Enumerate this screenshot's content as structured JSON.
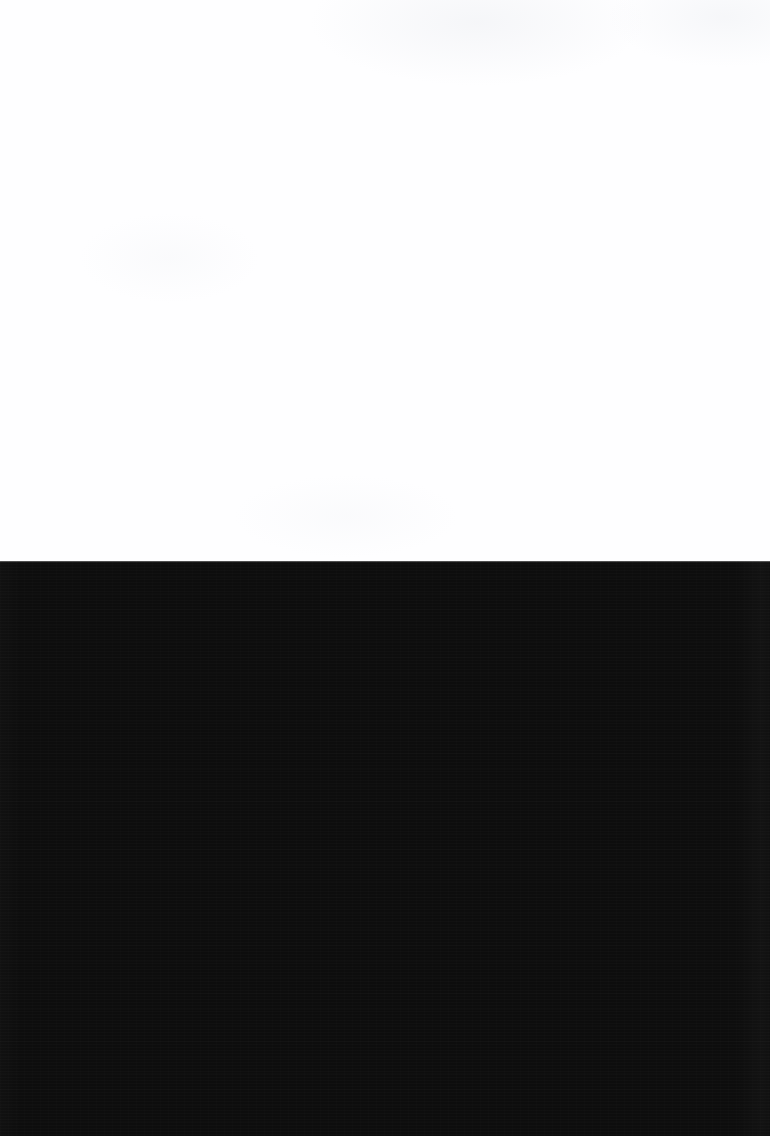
{
  "capture": {
    "width": 770,
    "height": 1136,
    "state_label": "",
    "description": ""
  },
  "regions": {
    "light_panel": {
      "name": "blank-white-content-area",
      "text": "",
      "background_color": "#fefeff",
      "top": 0,
      "height": 561,
      "height_percent": "49.4%"
    },
    "dark_panel": {
      "name": "blank-dark-viewport",
      "text": "",
      "background_color": "#0d0d0d",
      "top": 561,
      "height": 575,
      "height_percent": "50.6%"
    },
    "seam": {
      "name": "panel-divider",
      "y": 561,
      "color": "#6f6f6f"
    }
  },
  "colors": {
    "white": "#fefeff",
    "near_black": "#0d0d0d",
    "seam_highlight": "#6f6f6f"
  }
}
